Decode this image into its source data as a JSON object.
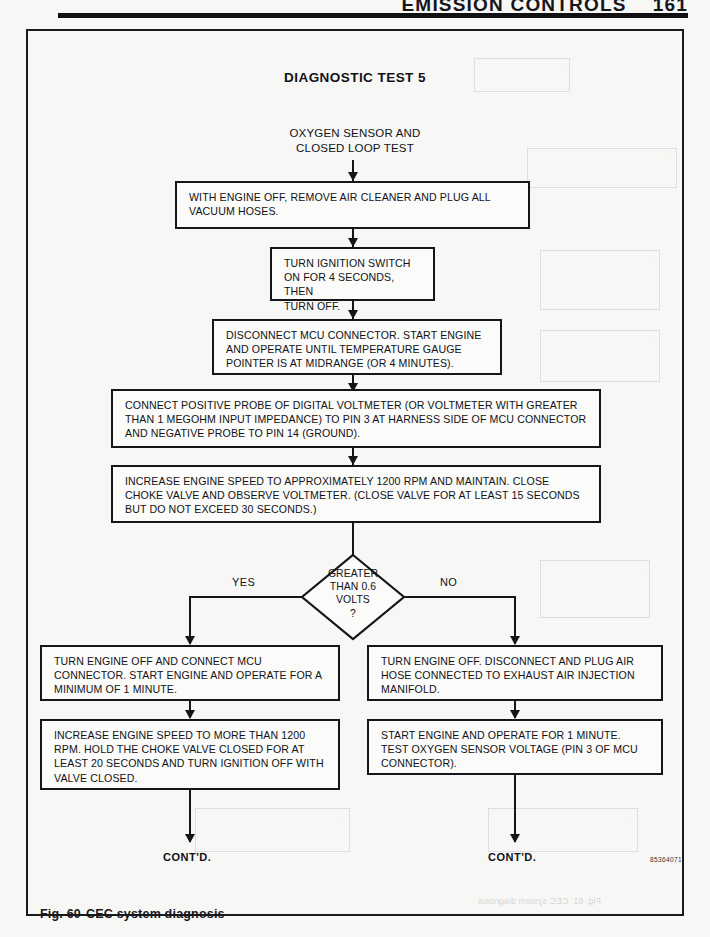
{
  "page": {
    "running_header": "EMISSION CONTROLS",
    "page_number": "161",
    "artwork_code": "85364071"
  },
  "figure": {
    "caption_number": "Fig. 60",
    "caption_text": "CEC system diagnosis",
    "title": "DIAGNOSTIC TEST 5",
    "subtitle_line1": "OXYGEN SENSOR AND",
    "subtitle_line2": "CLOSED LOOP TEST"
  },
  "flow": {
    "step1": "WITH ENGINE OFF, REMOVE AIR CLEANER AND PLUG ALL VACUUM HOSES.",
    "step2_line1": "TURN IGNITION SWITCH",
    "step2_line2": "ON FOR 4 SECONDS, THEN",
    "step2_line3": "TURN OFF.",
    "step3": "DISCONNECT MCU CONNECTOR. START ENGINE AND OPERATE UNTIL TEMPERATURE GAUGE POINTER IS AT MIDRANGE (OR 4 MINUTES).",
    "step4": "CONNECT POSITIVE PROBE OF DIGITAL VOLTMETER (OR VOLTMETER WITH GREATER THAN 1 MEGOHM INPUT IMPEDANCE) TO PIN 3 AT HARNESS SIDE OF MCU CONNECTOR AND NEGATIVE PROBE TO PIN 14 (GROUND).",
    "step5": "INCREASE ENGINE SPEED TO APPROXIMATELY 1200 RPM AND MAINTAIN. CLOSE CHOKE VALVE AND OBSERVE VOLTMETER. (CLOSE VALVE FOR AT LEAST 15 SECONDS BUT DO NOT EXCEED 30 SECONDS.)",
    "decision_line1": "GREATER",
    "decision_line2": "THAN 0.6",
    "decision_line3": "VOLTS",
    "decision_line4": "?",
    "branch_yes": "YES",
    "branch_no": "NO",
    "yes_step1": "TURN ENGINE OFF AND CONNECT MCU CONNECTOR. START ENGINE AND OPERATE FOR A MINIMUM OF 1 MINUTE.",
    "yes_step2": "INCREASE ENGINE SPEED TO MORE THAN 1200 RPM. HOLD THE CHOKE VALVE CLOSED FOR AT LEAST 20 SECONDS AND TURN IGNITION OFF WITH VALVE CLOSED.",
    "no_step1": "TURN ENGINE OFF. DISCONNECT AND PLUG AIR HOSE CONNECTED TO EXHAUST AIR INJECTION MANIFOLD.",
    "no_step2": "START ENGINE AND OPERATE FOR 1 MINUTE. TEST OXYGEN SENSOR VOLTAGE (PIN 3 OF MCU CONNECTOR).",
    "yes_terminal": "CONT'D.",
    "no_terminal": "CONT'D."
  },
  "colors": {
    "ink": "#15151a",
    "paper": "#f7f7f5"
  }
}
